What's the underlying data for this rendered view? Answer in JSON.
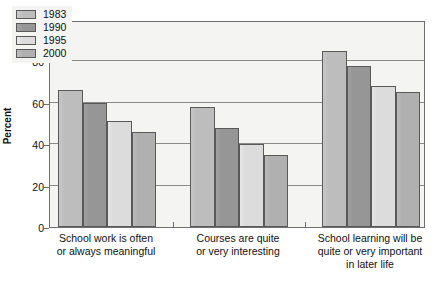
{
  "chart_data": {
    "type": "bar",
    "title": "",
    "xlabel": "",
    "ylabel": "Percent",
    "ylim": [
      0,
      100
    ],
    "yticks": [
      0,
      20,
      40,
      60,
      80,
      100
    ],
    "grid": true,
    "legend_position": "top-left",
    "categories": [
      "School work is often or always meaningful",
      "Courses are quite or very interesting",
      "School learning will be quite or very important in later life"
    ],
    "category_lines": [
      [
        "School work is often",
        "or always meaningful"
      ],
      [
        "Courses are quite",
        "or very interesting"
      ],
      [
        "School learning will be",
        "quite or very important",
        "in later life"
      ]
    ],
    "series": [
      {
        "name": "1983",
        "color": "#bdbdbd",
        "values": [
          66,
          58,
          85
        ]
      },
      {
        "name": "1990",
        "color": "#969696",
        "values": [
          60,
          48,
          78
        ]
      },
      {
        "name": "1995",
        "color": "#dcdcdc",
        "values": [
          51,
          40,
          68
        ]
      },
      {
        "name": "2000",
        "color": "#b0b0b0",
        "values": [
          46,
          35,
          65
        ]
      }
    ]
  },
  "axis": {
    "y_title": "Percent",
    "tick_labels": [
      "100",
      "80",
      "60",
      "40",
      "20",
      "0"
    ]
  },
  "legend": {
    "items": [
      {
        "label": "1983"
      },
      {
        "label": "1990"
      },
      {
        "label": "1995"
      },
      {
        "label": "2000"
      }
    ]
  },
  "colors": {
    "plot_background": "#f4f4f2",
    "axis_line": "#6f6f6f",
    "gridline": "#8a8a8a",
    "bar_border": "#595959",
    "text": "#111111"
  }
}
